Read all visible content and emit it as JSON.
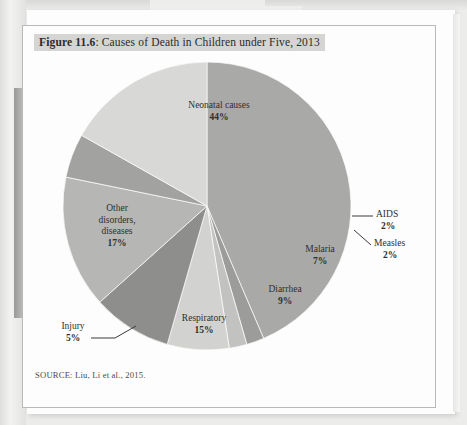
{
  "figure": {
    "number_label": "Figure 11.6",
    "title_separator": ": ",
    "title_text": "Causes of Death in Children under Five, 2013",
    "source_note": "SOURCE: Liu, Li et al., 2015."
  },
  "chart_data": {
    "type": "pie",
    "title": "Figure 11.6: Causes of Death in Children under Five, 2013",
    "xlabel": "",
    "ylabel": "",
    "legend_position": "none",
    "grid": false,
    "units": "percent",
    "total": 101,
    "categories": [
      "Neonatal causes",
      "AIDS",
      "Measles",
      "Malaria",
      "Diarrhea",
      "Respiratory",
      "Injury",
      "Other disorders, diseases"
    ],
    "values": [
      44,
      2,
      2,
      7,
      9,
      15,
      5,
      17
    ],
    "value_labels": [
      "44%",
      "2%",
      "2%",
      "7%",
      "9%",
      "15%",
      "5%",
      "17%"
    ],
    "slices": [
      {
        "name": "Neonatal causes",
        "label_line1": "Neonatal causes",
        "percent_label": "44%",
        "value": 44,
        "color": "#a9a9a7",
        "start_deg": 0,
        "end_deg": 158.4,
        "leader": false
      },
      {
        "name": "AIDS",
        "label_line1": "AIDS",
        "percent_label": "2%",
        "value": 2,
        "color": "#9c9c9a",
        "start_deg": 158.4,
        "end_deg": 165.6,
        "leader": true
      },
      {
        "name": "Measles",
        "label_line1": "Measles",
        "percent_label": "2%",
        "value": 2,
        "color": "#c2c2c0",
        "start_deg": 165.6,
        "end_deg": 172.8,
        "leader": true
      },
      {
        "name": "Malaria",
        "label_line1": "Malaria",
        "percent_label": "7%",
        "value": 7,
        "color": "#d2d2d0",
        "start_deg": 172.8,
        "end_deg": 198.0,
        "leader": false
      },
      {
        "name": "Diarrhea",
        "label_line1": "Diarrhea",
        "percent_label": "9%",
        "value": 9,
        "color": "#8e8e8c",
        "start_deg": 198.0,
        "end_deg": 230.4,
        "leader": false
      },
      {
        "name": "Respiratory",
        "label_line1": "Respiratory",
        "percent_label": "15%",
        "value": 15,
        "color": "#b6b6b4",
        "start_deg": 230.4,
        "end_deg": 284.4,
        "leader": false
      },
      {
        "name": "Injury",
        "label_line1": "Injury",
        "percent_label": "5%",
        "value": 5,
        "color": "#a2a2a0",
        "start_deg": 284.4,
        "end_deg": 302.4,
        "leader": true
      },
      {
        "name": "Other disorders, diseases",
        "label_line1": "Other",
        "label_line2": "disorders,",
        "label_line3": "diseases",
        "percent_label": "17%",
        "value": 17,
        "color": "#d8d8d6",
        "start_deg": 302.4,
        "end_deg": 363.6,
        "leader": false
      }
    ]
  },
  "colors": {
    "page": "#fdfdfd",
    "figure_border": "#b9b9b7",
    "title_highlight": "#d5d5d3",
    "text": "#2b2b2b",
    "source_text": "#4a4a4a",
    "leader_line": "#3a3a3a"
  }
}
